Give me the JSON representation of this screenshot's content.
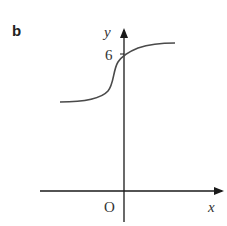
{
  "figure": {
    "panel_label": "b",
    "x_axis_label": "x",
    "y_axis_label": "y",
    "origin_label": "O",
    "y_intercept_label": "6"
  },
  "colors": {
    "axis": "#1a1a1a",
    "curve": "#4a4a4a",
    "text": "#333333"
  },
  "curve": {
    "description": "Increasing S-shaped (sigmoid-like) curve crossing y-axis at y = 6, with horizontal asymptotes on both sides",
    "y_intercept": 6
  }
}
